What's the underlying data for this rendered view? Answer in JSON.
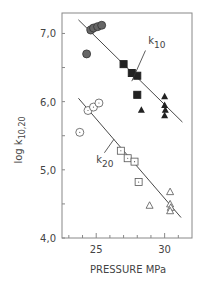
{
  "chart_data": {
    "type": "scatter",
    "title": "",
    "xlabel": "PRESSURE  MPa",
    "ylabel": "log k10,20",
    "ylabel_main": "log k",
    "ylabel_sub": "10,20",
    "xlim": [
      22.5,
      32
    ],
    "ylim": [
      4.0,
      7.3
    ],
    "x_ticks": [
      25,
      30
    ],
    "x_tick_labels": [
      "25",
      "30"
    ],
    "x_minor_ticks": [
      23,
      24,
      25,
      26,
      27,
      28,
      29,
      30,
      31
    ],
    "y_ticks": [
      4.0,
      5.0,
      6.0,
      7.0
    ],
    "y_tick_labels": [
      "4,0",
      "5,0",
      "6,0",
      "7,0"
    ],
    "y_minor_ticks": [
      4.5,
      5.5,
      6.5
    ],
    "grid": false,
    "annotations": [
      {
        "text": "k",
        "sub": "10",
        "x": 28.8,
        "y": 6.85,
        "leader_from": [
          28.6,
          6.75
        ],
        "leader_to": [
          27.6,
          6.3
        ]
      },
      {
        "text": "k",
        "sub": "20",
        "x": 25.0,
        "y": 5.1,
        "leader_from": [
          25.6,
          5.25
        ],
        "leader_to": [
          26.3,
          5.45
        ]
      }
    ],
    "series": [
      {
        "name": "k10 filled circles",
        "marker": "filled-circle",
        "color": "#555555",
        "points": [
          [
            24.3,
            6.7
          ],
          [
            24.6,
            7.05
          ],
          [
            24.8,
            7.08
          ],
          [
            25.1,
            7.1
          ],
          [
            25.4,
            7.12
          ]
        ]
      },
      {
        "name": "k10 filled squares",
        "marker": "filled-square",
        "color": "#222222",
        "points": [
          [
            27.0,
            6.55
          ],
          [
            27.6,
            6.42
          ],
          [
            28.0,
            6.38
          ],
          [
            28.0,
            6.1
          ]
        ]
      },
      {
        "name": "k10 filled triangles",
        "marker": "filled-triangle",
        "color": "#222222",
        "points": [
          [
            28.3,
            5.88
          ],
          [
            30.0,
            6.08
          ],
          [
            30.0,
            5.95
          ],
          [
            30.05,
            5.88
          ],
          [
            30.0,
            5.8
          ]
        ]
      },
      {
        "name": "k20 open circles",
        "marker": "open-circle",
        "color": "#555555",
        "points": [
          [
            23.8,
            5.55
          ],
          [
            24.4,
            5.87
          ],
          [
            24.8,
            5.92
          ],
          [
            25.2,
            5.98
          ]
        ]
      },
      {
        "name": "k20 open squares",
        "marker": "open-square",
        "color": "#555555",
        "points": [
          [
            26.8,
            5.28
          ],
          [
            27.3,
            5.17
          ],
          [
            27.8,
            5.12
          ],
          [
            28.1,
            4.82
          ]
        ]
      },
      {
        "name": "k20 open triangles",
        "marker": "open-triangle",
        "color": "#555555",
        "points": [
          [
            28.9,
            4.48
          ],
          [
            30.4,
            4.68
          ],
          [
            30.4,
            4.5
          ],
          [
            30.45,
            4.45
          ],
          [
            30.4,
            4.4
          ]
        ]
      }
    ],
    "fit_lines": [
      {
        "name": "k10",
        "from": [
          23.7,
          7.2
        ],
        "to": [
          31.3,
          5.7
        ]
      },
      {
        "name": "k20",
        "from": [
          23.7,
          6.05
        ],
        "to": [
          31.2,
          4.3
        ]
      }
    ]
  }
}
